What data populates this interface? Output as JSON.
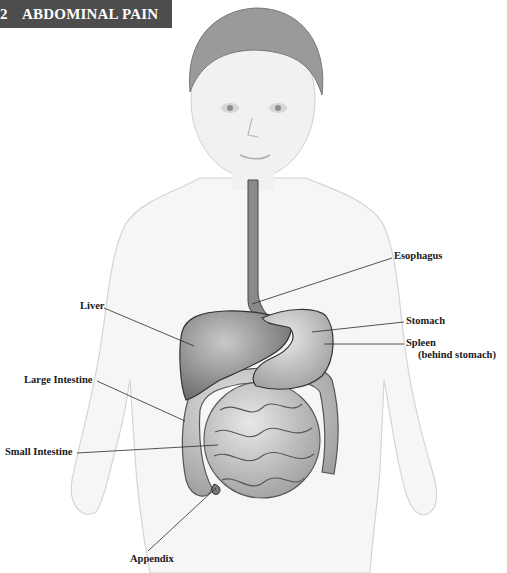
{
  "header": {
    "chapter_number": "2",
    "title": "ABDOMINAL PAIN",
    "bar_color": "#4d4d4d"
  },
  "figure": {
    "labels": [
      {
        "id": "esophagus",
        "text": "Esophagus"
      },
      {
        "id": "liver",
        "text": "Liver"
      },
      {
        "id": "stomach",
        "text": "Stomach"
      },
      {
        "id": "spleen",
        "text": "Spleen",
        "subtext": "(behind stomach)"
      },
      {
        "id": "large-intestine",
        "text": "Large Intestine"
      },
      {
        "id": "small-intestine",
        "text": "Small Intestine"
      },
      {
        "id": "appendix",
        "text": "Appendix"
      }
    ]
  }
}
